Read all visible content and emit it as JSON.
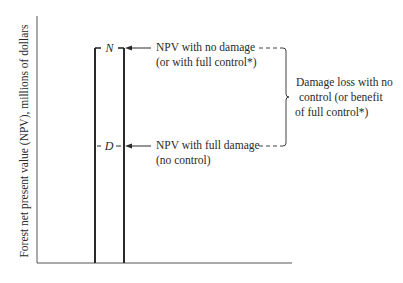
{
  "diagram": {
    "y_axis_label": "Forest net present value (NPV), millions of dollars",
    "x_axis_label": "",
    "markers": {
      "no_damage": "N",
      "full_damage": "D"
    },
    "annotations": {
      "no_damage_line1": "NPV with no damage",
      "no_damage_line2": "(or with full control*)",
      "full_damage_line1": "NPV with full damage",
      "full_damage_line2": "(no control)",
      "brace_line1": "Damage loss with no",
      "brace_line2": "control (or benefit",
      "brace_line3": "of full control*)"
    },
    "colors": {
      "ink": "#2a2a2a",
      "background": "#ffffff"
    }
  }
}
